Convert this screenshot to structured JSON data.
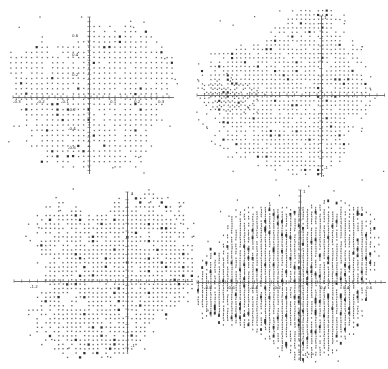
{
  "meta": {
    "width": 388,
    "height": 369,
    "background": "#ffffff"
  },
  "style": {
    "dot_color": "#3b3b3b",
    "dot_dark": "#1c1c1c",
    "axis_color": "#4a4a4a",
    "tick_color": "#555555",
    "label_color": "#333333",
    "dot_alpha": 0.78
  },
  "chart_data": [
    {
      "id": "top-left",
      "type": "scatter",
      "title": "",
      "xlabel": "",
      "ylabel": "",
      "xlim": [
        -0.32,
        0.35
      ],
      "ylim": [
        -0.84,
        0.84
      ],
      "grid": false,
      "legend": null,
      "lattice_spacing_data": {
        "dx": 0.022,
        "dy": 0.055
      },
      "axes_px": {
        "x_line": [
          13,
          97,
          174,
          97
        ],
        "y_line": [
          89,
          17,
          89,
          174
        ],
        "x_tick_step_px": 6,
        "y_tick_step_px": 4.8
      },
      "x_tick_labels": [
        {
          "t": "-0.3",
          "x": 17,
          "y": 99
        },
        {
          "t": "-0.2",
          "x": 41,
          "y": 99
        },
        {
          "t": "-0.1",
          "x": 65,
          "y": 99
        },
        {
          "t": "0.1",
          "x": 113,
          "y": 99
        },
        {
          "t": "0.2",
          "x": 137,
          "y": 99
        },
        {
          "t": "0.3",
          "x": 161,
          "y": 99
        }
      ],
      "y_tick_labels": [
        {
          "t": "0.6",
          "x": 79,
          "y": 36
        },
        {
          "t": "0.4",
          "x": 79,
          "y": 55
        },
        {
          "t": "0.2",
          "x": 79,
          "y": 75
        },
        {
          "t": "-0.2",
          "x": 77,
          "y": 110
        },
        {
          "t": "-0.4",
          "x": 77,
          "y": 129
        },
        {
          "t": "-0.6",
          "x": 77,
          "y": 148
        }
      ],
      "clip_px": [
        8,
        12,
        180,
        178
      ],
      "blobs": [
        {
          "seed": 101,
          "cx": 92,
          "cy": 95,
          "r": 74,
          "sx": 1.02,
          "sy": 1.0,
          "dx": 5.2,
          "dy": 5.2,
          "harm": [
            0.06,
            0.09,
            0.05,
            0.07
          ],
          "ph": [
            0.5,
            2.1,
            4.0,
            1.2
          ],
          "noise": 0.12,
          "dropout": 0.1,
          "outliers": 26,
          "dot": [
            1.3,
            1.3
          ]
        }
      ]
    },
    {
      "id": "top-right",
      "type": "scatter",
      "title": "",
      "xlabel": "",
      "ylabel": "",
      "xlim": [
        -1.65,
        0.85
      ],
      "ylim": [
        -1.07,
        1.05
      ],
      "grid": false,
      "legend": null,
      "lattice_spacing_data": {
        "dx": 0.057,
        "dy": 0.057
      },
      "axes_px": {
        "x_line": [
          197,
          95,
          385,
          95
        ],
        "y_line": [
          321,
          16,
          321,
          177
        ],
        "x_tick_step_px": 7.5,
        "y_tick_step_px": 7.5
      },
      "x_tick_labels": [],
      "y_tick_labels": [
        {
          "t": "1",
          "x": 324,
          "y": 18
        },
        {
          "t": "-1",
          "x": 324,
          "y": 168
        }
      ],
      "clip_px": [
        196,
        10,
        387,
        180
      ],
      "blobs": [
        {
          "seed": 202,
          "cx": 289,
          "cy": 94,
          "r": 77,
          "sx": 1.0,
          "sy": 1.05,
          "dx": 4.3,
          "dy": 4.3,
          "harm": [
            0.07,
            0.1,
            0.06,
            0.05
          ],
          "ph": [
            1.0,
            3.3,
            5.2,
            0.7
          ],
          "noise": 0.13,
          "dropout": 0.13,
          "outliers": 30,
          "dot": [
            1.25,
            1.25
          ]
        },
        {
          "seed": 203,
          "cx": 227,
          "cy": 95,
          "r": 21,
          "sx": 1.25,
          "sy": 0.8,
          "dx": 4.3,
          "dy": 4.3,
          "harm": [
            0.1,
            0.08,
            0.0,
            0.0
          ],
          "ph": [
            0.0,
            1.0,
            0.0,
            0.0
          ],
          "noise": 0.25,
          "dropout": 0.15,
          "outliers": 12,
          "dot": [
            1.25,
            1.25
          ]
        }
      ]
    },
    {
      "id": "bottom-left",
      "type": "scatter",
      "title": "",
      "xlabel": "",
      "ylabel": "",
      "xlim": [
        -1.45,
        0.85
      ],
      "ylim": [
        -1.05,
        1.15
      ],
      "grid": false,
      "legend": null,
      "lattice_spacing_data": {
        "dx": 0.055,
        "dy": 0.055
      },
      "axes_px": {
        "x_line": [
          14,
          281,
          193,
          281
        ],
        "y_line": [
          127,
          192,
          127,
          352
        ],
        "x_tick_step_px": 7.8,
        "y_tick_step_px": 7.8
      },
      "x_tick_labels": [
        {
          "t": "-1.2",
          "x": 34,
          "y": 284
        }
      ],
      "y_tick_labels": [
        {
          "t": "1",
          "x": 131,
          "y": 194
        },
        {
          "t": "-1",
          "x": 131,
          "y": 346
        }
      ],
      "clip_px": [
        8,
        188,
        196,
        358
      ],
      "blobs": [
        {
          "seed": 303,
          "cx": 112,
          "cy": 275,
          "r": 80,
          "sx": 1.05,
          "sy": 0.95,
          "dx": 4.3,
          "dy": 4.3,
          "harm": [
            0.09,
            0.1,
            0.06,
            0.07
          ],
          "ph": [
            2.0,
            0.8,
            3.9,
            5.5
          ],
          "noise": 0.14,
          "dropout": 0.13,
          "outliers": 28,
          "dot": [
            1.35,
            1.35
          ]
        }
      ]
    },
    {
      "id": "bottom-right",
      "type": "scatter",
      "title": "",
      "xlabel": "",
      "ylabel": "",
      "xlim": [
        -0.9,
        0.75
      ],
      "ylim": [
        -1.05,
        1.21
      ],
      "grid": false,
      "legend": null,
      "lattice_spacing_data": {
        "dx": 0.037,
        "dy": 0.03
      },
      "axes_px": {
        "x_line": [
          197,
          282,
          386,
          282
        ],
        "y_line": [
          300,
          190,
          300,
          361
        ],
        "x_tick_step_px": 5.75,
        "y_tick_step_px": 6.0
      },
      "x_tick_labels": [
        {
          "t": "-0.8",
          "x": 208,
          "y": 285
        },
        {
          "t": "-0.6",
          "x": 231,
          "y": 285
        },
        {
          "t": "-0.4",
          "x": 254,
          "y": 285
        },
        {
          "t": "-0.2",
          "x": 277,
          "y": 285
        },
        {
          "t": "0.2",
          "x": 323,
          "y": 285
        },
        {
          "t": "0.4",
          "x": 346,
          "y": 285
        },
        {
          "t": "0.6",
          "x": 369,
          "y": 285
        }
      ],
      "y_tick_labels": [
        {
          "t": "1",
          "x": 303,
          "y": 192
        },
        {
          "t": "-1",
          "x": 303,
          "y": 355
        }
      ],
      "clip_px": [
        196,
        186,
        387,
        363
      ],
      "blobs": [
        {
          "seed": 404,
          "cx": 292,
          "cy": 276,
          "r": 78,
          "sx": 1.05,
          "sy": 1.0,
          "dx": 4.2,
          "dy": 2.3,
          "harm": [
            0.06,
            0.09,
            0.08,
            0.05
          ],
          "ph": [
            0.3,
            2.8,
            1.7,
            4.4
          ],
          "noise": 0.11,
          "dropout": 0.06,
          "outliers": 26,
          "dot": [
            1.1,
            1.6
          ]
        }
      ]
    }
  ]
}
